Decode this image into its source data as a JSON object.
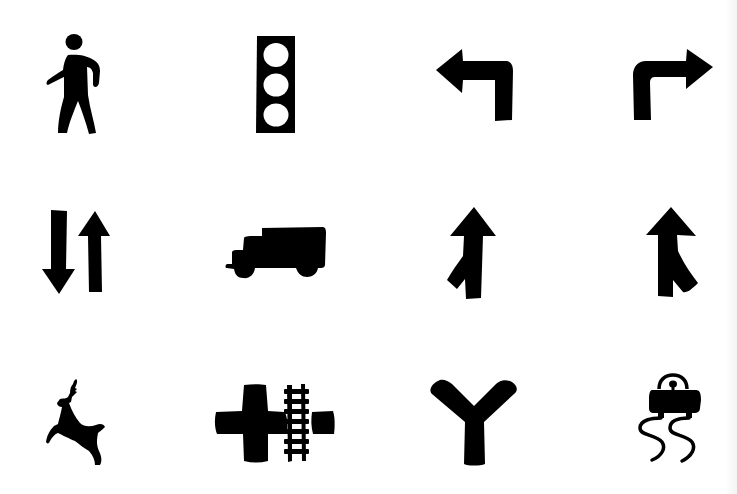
{
  "sheet": {
    "background": "#ffffff",
    "ink_color": "#000000",
    "rows": 3,
    "columns": 4
  },
  "icons": [
    {
      "row": 1,
      "col": 1,
      "name": "pedestrian",
      "label": "Pedestrian crossing"
    },
    {
      "row": 1,
      "col": 2,
      "name": "traffic-light",
      "label": "Traffic signal"
    },
    {
      "row": 1,
      "col": 3,
      "name": "left-turn-arrow",
      "label": "Left turn"
    },
    {
      "row": 1,
      "col": 4,
      "name": "right-turn-arrow",
      "label": "Right turn"
    },
    {
      "row": 2,
      "col": 1,
      "name": "two-way-traffic",
      "label": "Two-way traffic"
    },
    {
      "row": 2,
      "col": 2,
      "name": "truck",
      "label": "Truck"
    },
    {
      "row": 2,
      "col": 3,
      "name": "merge-from-left",
      "label": "Merge from left"
    },
    {
      "row": 2,
      "col": 4,
      "name": "merge-from-right",
      "label": "Merge from right"
    },
    {
      "row": 3,
      "col": 1,
      "name": "deer-crossing",
      "label": "Deer crossing"
    },
    {
      "row": 3,
      "col": 2,
      "name": "railroad-crossing",
      "label": "Railroad crossing with intersection"
    },
    {
      "row": 3,
      "col": 3,
      "name": "y-junction",
      "label": "Y intersection"
    },
    {
      "row": 3,
      "col": 4,
      "name": "slippery-road",
      "label": "Slippery when wet"
    }
  ]
}
